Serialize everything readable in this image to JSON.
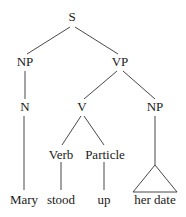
{
  "tree": {
    "nodes": [
      {
        "id": "S",
        "label": "S",
        "x": 72,
        "y": 10
      },
      {
        "id": "NP1",
        "label": "NP",
        "x": 25,
        "y": 55
      },
      {
        "id": "VP",
        "label": "VP",
        "x": 120,
        "y": 55
      },
      {
        "id": "N",
        "label": "N",
        "x": 25,
        "y": 100
      },
      {
        "id": "V",
        "label": "V",
        "x": 82,
        "y": 100
      },
      {
        "id": "NP2",
        "label": "NP",
        "x": 155,
        "y": 100
      },
      {
        "id": "Verb",
        "label": "Verb",
        "x": 61,
        "y": 148
      },
      {
        "id": "Particle",
        "label": "Particle",
        "x": 105,
        "y": 148
      },
      {
        "id": "Mary",
        "label": "Mary",
        "x": 24,
        "y": 192
      },
      {
        "id": "stood",
        "label": "stood",
        "x": 61,
        "y": 192
      },
      {
        "id": "up",
        "label": "up",
        "x": 104,
        "y": 192
      },
      {
        "id": "her_date",
        "label": "her date",
        "x": 155,
        "y": 192
      }
    ],
    "edges": [
      [
        "S",
        "NP1"
      ],
      [
        "S",
        "VP"
      ],
      [
        "NP1",
        "N"
      ],
      [
        "N",
        "Mary"
      ],
      [
        "VP",
        "V"
      ],
      [
        "VP",
        "NP2"
      ],
      [
        "V",
        "Verb"
      ],
      [
        "V",
        "Particle"
      ],
      [
        "Verb",
        "stood"
      ],
      [
        "Particle",
        "up"
      ]
    ],
    "triangle": {
      "parent": "NP2",
      "child": "her_date"
    }
  },
  "labels": {
    "S": "S",
    "NP1": "NP",
    "VP": "VP",
    "N": "N",
    "V": "V",
    "NP2": "NP",
    "Verb": "Verb",
    "Particle": "Particle",
    "Mary": "Mary",
    "stood": "stood",
    "up": "up",
    "her_date": "her date"
  }
}
